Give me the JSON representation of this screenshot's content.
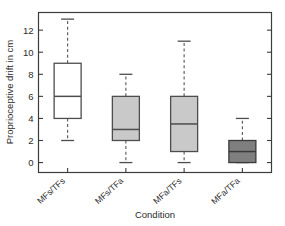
{
  "chart_data": {
    "type": "box",
    "title": "",
    "xlabel": "Condition",
    "ylabel": "Proprioceptive drift in cm",
    "categories": [
      "MFs/TFs",
      "MFs/TFa",
      "MFa/TFs",
      "MFa/TFa"
    ],
    "ylim": [
      -0.9,
      13.6
    ],
    "yticks": [
      0,
      2,
      4,
      6,
      8,
      10,
      12
    ],
    "ytick_labels": [
      "0",
      "2",
      "4",
      "6",
      "8",
      "10",
      "12"
    ],
    "grid": false,
    "legend": "none",
    "boxes": [
      {
        "category": "MFs/TFs",
        "whisker_low": 2,
        "q1": 4,
        "median": 6,
        "q3": 9,
        "whisker_high": 13,
        "fill": "#ffffff",
        "edge": "#4d4d4d"
      },
      {
        "category": "MFs/TFa",
        "whisker_low": 0,
        "q1": 2,
        "median": 3,
        "q3": 6,
        "whisker_high": 8,
        "fill": "#c9c9c9",
        "edge": "#4d4d4d"
      },
      {
        "category": "MFa/TFs",
        "whisker_low": 0,
        "q1": 1,
        "median": 3.5,
        "q3": 6,
        "whisker_high": 11,
        "fill": "#c9c9c9",
        "edge": "#4d4d4d"
      },
      {
        "category": "MFa/TFa",
        "whisker_low": 0,
        "q1": 0,
        "median": 1,
        "q3": 2,
        "whisker_high": 4,
        "fill": "#7f7f7f",
        "edge": "#3a3a3a"
      }
    ]
  },
  "axes": {
    "frame_color": "#3c3c3c",
    "tick_color": "#3c3c3c"
  }
}
